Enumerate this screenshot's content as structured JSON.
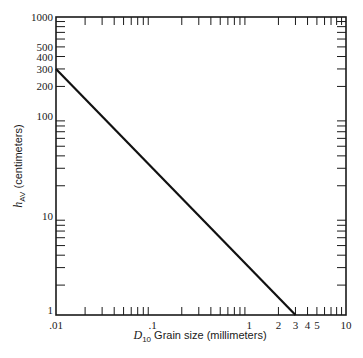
{
  "chart_data": {
    "type": "line",
    "title": "",
    "xlabel": "D10 Grain size (millimeters)",
    "xlabel_parts": {
      "symbol": "D",
      "subscript": "10",
      "text": " Grain size (millimeters)"
    },
    "ylabel": "hAV (centimeters)",
    "ylabel_parts": {
      "symbol": "h",
      "subscript": "AV",
      "text": " (centimeters)"
    },
    "xscale": "log",
    "yscale": "log",
    "xlim": [
      0.01,
      10
    ],
    "ylim": [
      1,
      1000
    ],
    "grid": false,
    "legend": null,
    "x_tick_labels": [
      {
        "value": 0.01,
        "label": ".01"
      },
      {
        "value": 0.1,
        "label": ".1"
      },
      {
        "value": 1,
        "label": "1"
      },
      {
        "value": 2,
        "label": "2"
      },
      {
        "value": 3,
        "label": "3"
      },
      {
        "value": 4,
        "label": "4"
      },
      {
        "value": 5,
        "label": "5"
      },
      {
        "value": 10,
        "label": "10"
      }
    ],
    "y_tick_labels": [
      {
        "value": 1,
        "label": "1"
      },
      {
        "value": 10,
        "label": "10"
      },
      {
        "value": 100,
        "label": "100"
      },
      {
        "value": 200,
        "label": "200"
      },
      {
        "value": 300,
        "label": "300"
      },
      {
        "value": 400,
        "label": "400"
      },
      {
        "value": 500,
        "label": "500"
      },
      {
        "value": 1000,
        "label": "1000"
      }
    ],
    "series": [
      {
        "name": "hAV vs D10",
        "x": [
          0.01,
          3
        ],
        "y": [
          300,
          1
        ]
      }
    ]
  },
  "style": {
    "line_color": "#111111",
    "axis_color": "#1a1a1a",
    "background": "#ffffff"
  }
}
